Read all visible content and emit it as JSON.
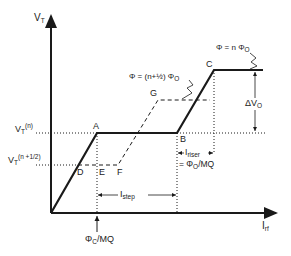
{
  "diagram": {
    "axes": {
      "y_label": "V",
      "y_label_sub": "T",
      "x_label": "I",
      "x_label_sub": "rf"
    },
    "levels": {
      "vt_n": "V",
      "vt_n_sub": "T",
      "vt_n_sup": "(n)",
      "vt_half": "V",
      "vt_half_sub": "T",
      "vt_half_sup": "(n +1/2)"
    },
    "points": {
      "A": "A",
      "B": "B",
      "C": "C",
      "D": "D",
      "E": "E",
      "F": "F",
      "G": "G"
    },
    "annotations": {
      "phi_n": "Φ = n Φ",
      "phi_n_sub": "O",
      "phi_half": "Φ = (n+½) Φ",
      "phi_half_sub": "O",
      "delta_v": "ΔV",
      "delta_v_sub": "O",
      "i_riser": "I",
      "i_riser_sub": "riser",
      "i_riser_eq": "= Φ",
      "i_riser_eq_sub": "O",
      "i_riser_eq_tail": "/MQ",
      "i_step": "I",
      "i_step_sub": "step",
      "phi_c": "Φ",
      "phi_c_sub": "C",
      "phi_c_tail": "/MQ"
    },
    "colors": {
      "line": "#1a1a1a",
      "background": "#ffffff"
    }
  }
}
